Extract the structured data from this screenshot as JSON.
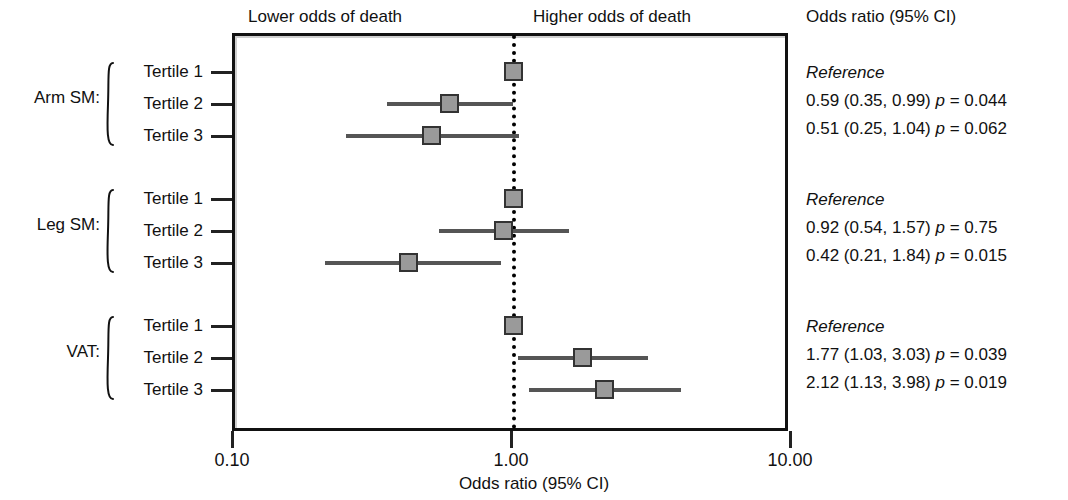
{
  "header": {
    "lower_label": "Lower odds of death",
    "higher_label": "Higher odds of death",
    "stats_column_header": "Odds ratio (95% CI)"
  },
  "axis": {
    "title": "Odds ratio (95% CI)",
    "ticks": [
      "0.10",
      "1.00",
      "10.00"
    ]
  },
  "groups": [
    {
      "label": "Arm SM:"
    },
    {
      "label": "Leg SM:"
    },
    {
      "label": "VAT:"
    }
  ],
  "rows": [
    {
      "category": "Tertile 1",
      "stat": "Reference"
    },
    {
      "category": "Tertile 2",
      "stat": "0.59 (0.35, 0.99) p = 0.044"
    },
    {
      "category": "Tertile 3",
      "stat": "0.51 (0.25, 1.04) p = 0.062"
    },
    {
      "category": "Tertile 1",
      "stat": "Reference"
    },
    {
      "category": "Tertile 2",
      "stat": "0.92 (0.54, 1.57) p = 0.75"
    },
    {
      "category": "Tertile 3",
      "stat": "0.42 (0.21, 1.84) p = 0.015"
    },
    {
      "category": "Tertile 1",
      "stat": "Reference"
    },
    {
      "category": "Tertile 2",
      "stat": "1.77 (1.03, 3.03) p = 0.039"
    },
    {
      "category": "Tertile 3",
      "stat": "2.12 (1.13, 3.98) p = 0.019"
    }
  ],
  "chart_data": {
    "type": "forest",
    "title": "",
    "xlabel": "Odds ratio (95% CI)",
    "ylabel": "",
    "xscale": "log",
    "xlim": [
      0.1,
      10.0
    ],
    "xticks": [
      0.1,
      1.0,
      10.0
    ],
    "xticklabels": [
      "0.10",
      "1.00",
      "10.00"
    ],
    "reference_line": 1.0,
    "grid": false,
    "annotations": [
      {
        "text": "Lower odds of death",
        "side": "left-of-null"
      },
      {
        "text": "Higher odds of death",
        "side": "right-of-null"
      }
    ],
    "groups": [
      {
        "name": "Arm SM:",
        "points": [
          {
            "label": "Tertile 1",
            "estimate": 1.0,
            "ci_low": null,
            "ci_high": null,
            "p": null,
            "reference": true,
            "text": "Reference"
          },
          {
            "label": "Tertile 2",
            "estimate": 0.59,
            "ci_low": 0.35,
            "ci_high": 0.99,
            "p": 0.044,
            "reference": false,
            "text": "0.59 (0.35, 0.99) p = 0.044"
          },
          {
            "label": "Tertile 3",
            "estimate": 0.51,
            "ci_low": 0.25,
            "ci_high": 1.04,
            "p": 0.062,
            "reference": false,
            "text": "0.51 (0.25, 1.04) p = 0.062"
          }
        ]
      },
      {
        "name": "Leg SM:",
        "points": [
          {
            "label": "Tertile 1",
            "estimate": 1.0,
            "ci_low": null,
            "ci_high": null,
            "p": null,
            "reference": true,
            "text": "Reference"
          },
          {
            "label": "Tertile 2",
            "estimate": 0.92,
            "ci_low": 0.54,
            "ci_high": 1.57,
            "p": 0.75,
            "reference": false,
            "text": "0.92 (0.54, 1.57) p = 0.75"
          },
          {
            "label": "Tertile 3",
            "estimate": 0.42,
            "ci_low": 0.21,
            "ci_high": 0.9,
            "p": 0.015,
            "reference": false,
            "text": "0.42 (0.21, 1.84) p = 0.015"
          }
        ]
      },
      {
        "name": "VAT:",
        "points": [
          {
            "label": "Tertile 1",
            "estimate": 1.0,
            "ci_low": null,
            "ci_high": null,
            "p": null,
            "reference": true,
            "text": "Reference"
          },
          {
            "label": "Tertile 2",
            "estimate": 1.77,
            "ci_low": 1.03,
            "ci_high": 3.03,
            "p": 0.039,
            "reference": false,
            "text": "1.77 (1.03, 3.03) p = 0.039"
          },
          {
            "label": "Tertile 3",
            "estimate": 2.12,
            "ci_low": 1.13,
            "ci_high": 3.98,
            "p": 0.019,
            "reference": false,
            "text": "2.12 (1.13, 3.98) p = 0.019"
          }
        ]
      }
    ],
    "colors": {
      "marker_fill": "#9a9a9a",
      "marker_edge": "#333333",
      "ci_line": "#555555",
      "frame": "#111111",
      "reference_line_color": "#000000"
    }
  },
  "layout": {
    "row_y": [
      72,
      104,
      136,
      199,
      231,
      263,
      326,
      358,
      390
    ],
    "group_label_y": [
      97,
      224,
      351
    ],
    "brace": [
      {
        "top": 62,
        "height": 84
      },
      {
        "top": 189,
        "height": 84
      },
      {
        "top": 316,
        "height": 84
      }
    ],
    "stat_y": [
      72,
      100,
      128,
      199,
      227,
      255,
      326,
      354,
      382
    ]
  }
}
